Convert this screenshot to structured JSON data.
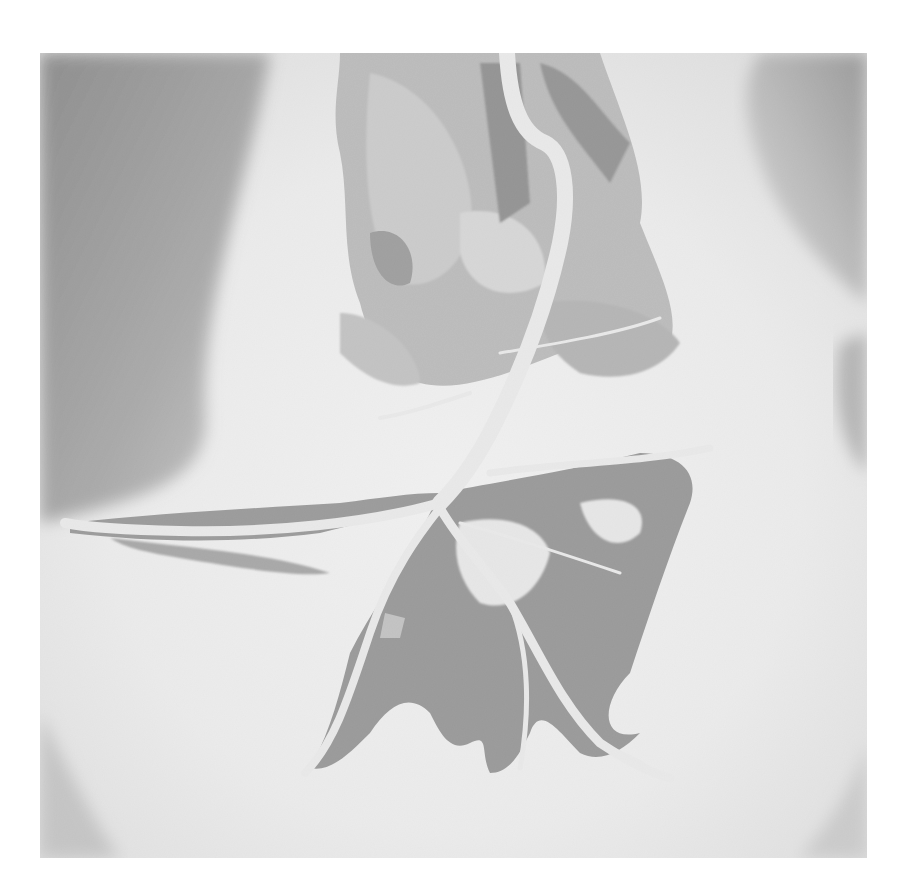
{
  "image": {
    "subject": "Grayscale satellite photograph of a bird's-foot river delta",
    "alt": "Aerial view of a river delta with a main channel branching into several distributaries extending into a sediment-laden sea",
    "colors": {
      "page_background": "#ffffff",
      "dark_water": "#2e2e2e",
      "mid_water": "#8a8a8a",
      "sediment_plume": "#dcdcdc",
      "marsh_land": "#3a3a3a",
      "channel": "#d2d2d2"
    },
    "features": [
      {
        "name": "main-river-channel",
        "description": "Main river channel entering from the top and meandering south"
      },
      {
        "name": "west-pass",
        "description": "Long distributary extending west to the left edge"
      },
      {
        "name": "east-pass",
        "description": "Distributary branching east toward the right"
      },
      {
        "name": "southwest-pass",
        "description": "Distributary extending southwest"
      },
      {
        "name": "south-pass",
        "description": "Distributary extending south"
      },
      {
        "name": "southeast-pass",
        "description": "Distributary extending southeast"
      },
      {
        "name": "sediment-plume",
        "description": "Light-toned turbid water surrounding the delta"
      },
      {
        "name": "dark-open-water",
        "description": "Darker clear water in the upper-left and upper-right corners"
      }
    ]
  }
}
